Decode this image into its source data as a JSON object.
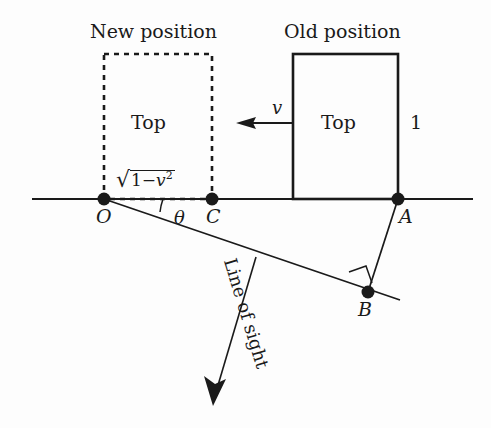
{
  "figure": {
    "title_new": "New position",
    "title_old": "Old position",
    "box_new_label": "Top",
    "box_old_label": "Top",
    "height_label": "1",
    "velocity_label": "v",
    "angle_label": "θ",
    "line_of_sight_label": "Line of sight",
    "contracted_length": {
      "radical": "√",
      "one": "1",
      "minus": "−",
      "v": "v",
      "exponent": "2",
      "full_text": "√(1 − v²)"
    },
    "points": {
      "O": "O",
      "C": "C",
      "A": "A",
      "B": "B"
    },
    "colors": {
      "stroke": "#1a1a1a",
      "background": "#fdfdfd",
      "text": "#1a1a1a"
    }
  }
}
